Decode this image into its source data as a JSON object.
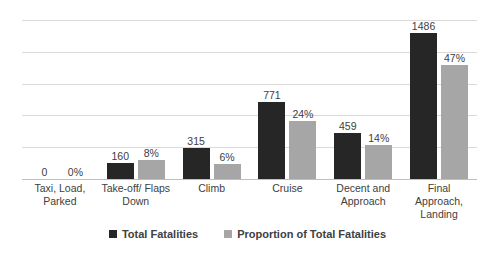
{
  "chart_data": {
    "type": "bar",
    "title": "",
    "xlabel": "",
    "ylabel": "",
    "grid": true,
    "legend_position": "bottom",
    "ylim": [
      0,
      1600
    ],
    "gridline_count": 5,
    "categories": [
      "Taxi, Load, Parked",
      "Take-off/ Flaps Down",
      "Climb",
      "Cruise",
      "Decent and Approach",
      "Final Approach, Landing"
    ],
    "series": [
      {
        "name": "Total Fatalities",
        "color": "#262626",
        "values": [
          0,
          160,
          315,
          771,
          459,
          1486
        ],
        "labels": [
          "0",
          "160",
          "315",
          "771",
          "459",
          "1486"
        ]
      },
      {
        "name": "Proportion of Total Fatalities",
        "color": "#a6a6a6",
        "values": [
          0,
          8,
          6,
          24,
          14,
          47
        ],
        "labels": [
          "0%",
          "8%",
          "6%",
          "24%",
          "14%",
          "47%"
        ]
      }
    ]
  },
  "legend": {
    "items": [
      {
        "label": "Total Fatalities",
        "swatch": "primary"
      },
      {
        "label": "Proportion of Total Fatalities",
        "swatch": "secondary"
      }
    ]
  },
  "colors": {
    "primary": "#262626",
    "secondary": "#a6a6a6",
    "gridline": "#d9d9d9",
    "text": "#404040",
    "background": "#ffffff"
  }
}
